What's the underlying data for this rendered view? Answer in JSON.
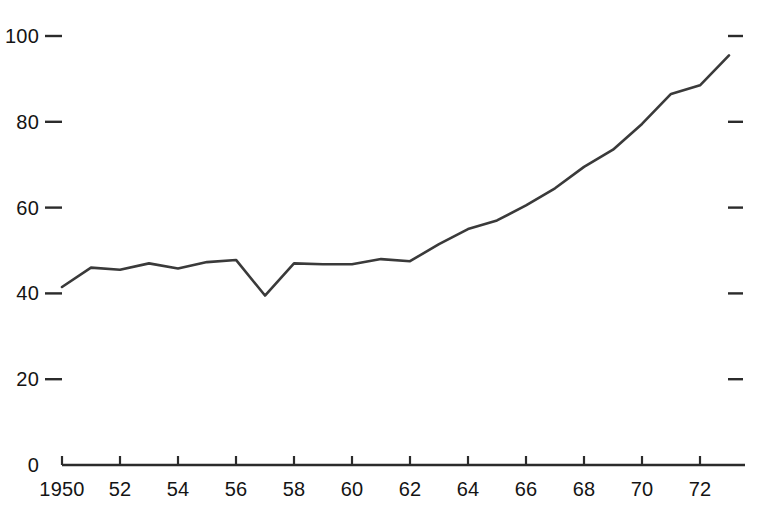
{
  "chart_data": {
    "type": "line",
    "title": "",
    "subtitle": "",
    "xlabel": "",
    "ylabel": "",
    "xlim": [
      1950,
      1973.6
    ],
    "ylim": [
      0,
      108
    ],
    "grid": false,
    "legend": null,
    "x": [
      1950,
      1951,
      1952,
      1953,
      1954,
      1955,
      1956,
      1957,
      1958,
      1959,
      1960,
      1961,
      1962,
      1963,
      1964,
      1965,
      1966,
      1967,
      1968,
      1969,
      1970,
      1971,
      1972,
      1973
    ],
    "values": [
      41.5,
      46.0,
      45.5,
      47.0,
      45.8,
      47.3,
      47.8,
      39.5,
      47.0,
      46.8,
      46.8,
      48.0,
      47.5,
      51.5,
      55.0,
      57.0,
      60.5,
      64.5,
      69.5,
      73.5,
      79.5,
      86.5,
      88.5,
      95.5
    ],
    "series": [
      {
        "name": "series-1",
        "values": [
          41.5,
          46.0,
          45.5,
          47.0,
          45.8,
          47.3,
          47.8,
          39.5,
          47.0,
          46.8,
          46.8,
          48.0,
          47.5,
          51.5,
          55.0,
          57.0,
          60.5,
          64.5,
          69.5,
          73.5,
          79.5,
          86.5,
          88.5,
          95.5
        ],
        "color": "#3a3a3a"
      }
    ],
    "y_ticks": [
      0,
      20,
      40,
      60,
      80,
      100
    ],
    "y_tick_labels": [
      "0",
      "20",
      "40",
      "60",
      "80",
      "100"
    ],
    "x_ticks": [
      1950,
      1952,
      1954,
      1956,
      1958,
      1960,
      1962,
      1964,
      1966,
      1968,
      1970,
      1972
    ],
    "x_tick_labels": [
      "1950",
      "52",
      "54",
      "56",
      "58",
      "60",
      "62",
      "64",
      "66",
      "68",
      "70",
      "72"
    ],
    "right_axis_ticks": [
      20,
      40,
      60,
      80,
      100
    ],
    "line_color": "#3a3a3a",
    "axis_color": "#2b2b2b",
    "background_color": "#ffffff"
  }
}
